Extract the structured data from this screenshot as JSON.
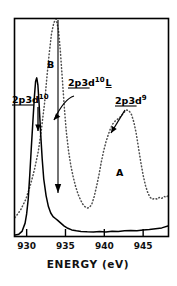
{
  "figure": {
    "title": "",
    "background_color": "#ffffff",
    "frame_color": "#000000"
  },
  "chart_data": {
    "type": "line",
    "title": "",
    "subtitle": "",
    "xlabel": "ENERGY (eV)",
    "ylabel": "",
    "xlim": [
      928.5,
      948.2
    ],
    "ylim": [
      0,
      1.18
    ],
    "grid": false,
    "legend_position": "none",
    "xticks": [
      930,
      935,
      940,
      945
    ],
    "xtick_labels": [
      "930",
      "935",
      "940",
      "945"
    ],
    "yticks": [],
    "ytick_labels": [],
    "series": [
      {
        "name": "solid-spectrum",
        "style": "solid",
        "color": "#000000",
        "x": [
          928.5,
          929.0,
          929.4,
          929.8,
          930.0,
          930.2,
          930.4,
          930.6,
          930.8,
          931.0,
          931.15,
          931.3,
          931.45,
          931.6,
          931.8,
          932.0,
          932.2,
          932.5,
          932.8,
          933.1,
          933.4,
          933.7,
          934.0,
          934.4,
          934.8,
          935.3,
          935.8,
          936.4,
          937.0,
          937.8,
          938.6,
          939.4,
          940.2,
          941.0,
          941.8,
          942.6,
          943.4,
          944.2,
          945.0,
          945.8,
          946.6,
          947.4,
          948.2
        ],
        "y": [
          0.005,
          0.01,
          0.025,
          0.07,
          0.12,
          0.2,
          0.33,
          0.48,
          0.62,
          0.76,
          0.84,
          0.86,
          0.82,
          0.72,
          0.56,
          0.42,
          0.31,
          0.22,
          0.16,
          0.125,
          0.105,
          0.095,
          0.085,
          0.07,
          0.055,
          0.042,
          0.033,
          0.028,
          0.025,
          0.023,
          0.022,
          0.024,
          0.022,
          0.026,
          0.024,
          0.028,
          0.03,
          0.029,
          0.032,
          0.035,
          0.04,
          0.044,
          0.055
        ]
      },
      {
        "name": "dotted-spectrum",
        "style": "dotted",
        "color": "#4d4d4d",
        "x": [
          928.5,
          929.2,
          929.9,
          930.5,
          931.0,
          931.5,
          931.9,
          932.3,
          932.6,
          932.9,
          933.2,
          933.5,
          933.8,
          934.1,
          934.35,
          934.6,
          934.85,
          935.1,
          935.4,
          935.7,
          936.0,
          936.3,
          936.6,
          936.9,
          937.2,
          937.5,
          937.8,
          938.1,
          938.4,
          938.7,
          939.0,
          939.3,
          939.6,
          939.9,
          940.2,
          940.5,
          940.8,
          941.1,
          941.4,
          941.7,
          942.0,
          942.3,
          942.6,
          942.9,
          943.2,
          943.5,
          943.8,
          944.1,
          944.4,
          944.7,
          945.0,
          945.3,
          945.6,
          945.9,
          946.2,
          946.5,
          946.8,
          947.1,
          947.4,
          947.7,
          948.0,
          948.2
        ],
        "y": [
          0.1,
          0.14,
          0.2,
          0.28,
          0.36,
          0.46,
          0.58,
          0.72,
          0.86,
          0.99,
          1.1,
          1.16,
          1.18,
          1.12,
          1.0,
          0.85,
          0.7,
          0.57,
          0.46,
          0.38,
          0.32,
          0.27,
          0.23,
          0.2,
          0.175,
          0.16,
          0.152,
          0.155,
          0.175,
          0.215,
          0.27,
          0.33,
          0.4,
          0.46,
          0.51,
          0.55,
          0.585,
          0.61,
          0.625,
          0.635,
          0.645,
          0.66,
          0.675,
          0.685,
          0.68,
          0.66,
          0.62,
          0.56,
          0.48,
          0.4,
          0.33,
          0.275,
          0.235,
          0.21,
          0.2,
          0.205,
          0.2,
          0.21,
          0.205,
          0.215,
          0.21,
          0.22
        ]
      }
    ],
    "annotations": [
      {
        "id": "label-2p3d10",
        "text_parts": {
          "base": "2p3d",
          "sup": "10",
          "sub": ""
        },
        "text": "2p3d10",
        "underline": true,
        "x_px": 12,
        "y_px": 103,
        "arrow": {
          "type": "straight-down",
          "from_px": [
            38,
            107
          ],
          "to_px": [
            38,
            131
          ]
        }
      },
      {
        "id": "label-2p3d10L",
        "text_parts": {
          "base": "2p3d",
          "sup": "10",
          "sub": "L"
        },
        "text": "2p3d10 L",
        "underline": true,
        "x_px": 68,
        "y_px": 86,
        "arrow": {
          "type": "curved",
          "from_px": [
            74,
            96
          ],
          "to_px": [
            54,
            120
          ]
        }
      },
      {
        "id": "label-2p3d9",
        "text_parts": {
          "base": "2p3d",
          "sup": "9",
          "sub": ""
        },
        "text": "2p3d9",
        "underline": true,
        "x_px": 115,
        "y_px": 104,
        "arrow": {
          "type": "diagonal",
          "from_px": [
            125,
            110
          ],
          "to_px": [
            111,
            133
          ]
        }
      },
      {
        "id": "label-B",
        "text": "B",
        "underline": false,
        "x_px": 47,
        "y_px": 68,
        "arrow": null
      },
      {
        "id": "label-A",
        "text": "A",
        "underline": false,
        "x_px": 116,
        "y_px": 176,
        "arrow": null
      }
    ],
    "span_marker": {
      "id": "vertical-double-arrow",
      "x_px": 58,
      "top_px": 20,
      "bottom_px": 193,
      "double_headed": true
    }
  }
}
